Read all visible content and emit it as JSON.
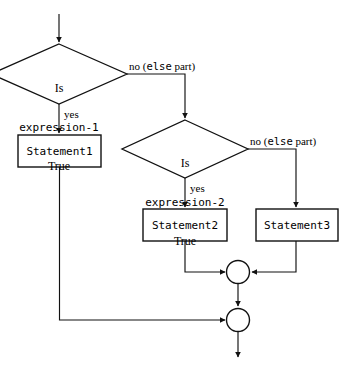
{
  "diagram": {
    "stroke_color": "#111111",
    "fill_color": "#ffffff",
    "background": "#ffffff",
    "decisions": [
      {
        "id": "decision-1",
        "line1": "Is",
        "line2": "expression-1",
        "line3": "True",
        "yes_label": "yes",
        "no_label_plain": "no (",
        "no_label_mono": "else",
        "no_label_tail": " part)"
      },
      {
        "id": "decision-2",
        "line1": "Is",
        "line2": "expression-2",
        "line3": "True",
        "yes_label": "yes",
        "no_label_plain": "no (",
        "no_label_mono": "else",
        "no_label_tail": " part)"
      }
    ],
    "processes": [
      {
        "id": "statement-1",
        "label": "Statement1"
      },
      {
        "id": "statement-2",
        "label": "Statement2"
      },
      {
        "id": "statement-3",
        "label": "Statement3"
      }
    ],
    "connectors": [
      {
        "id": "merge-node-upper",
        "label": ""
      },
      {
        "id": "merge-node-lower",
        "label": ""
      }
    ]
  }
}
